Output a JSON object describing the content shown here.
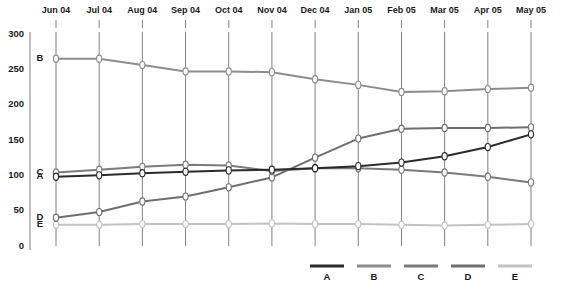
{
  "chart_data": {
    "type": "line",
    "title": "",
    "xlabel": "",
    "ylabel": "",
    "categories": [
      "Jun 04",
      "Jul 04",
      "Aug 04",
      "Sep 04",
      "Oct 04",
      "Nov 04",
      "Dec 04",
      "Jan 05",
      "Feb 05",
      "Mar 05",
      "Apr 05",
      "May 05"
    ],
    "ylim": [
      0,
      300
    ],
    "yticks": [
      0,
      50,
      100,
      150,
      200,
      250,
      300
    ],
    "grid": "vertical",
    "legend_position": "bottom-right",
    "series": [
      {
        "name": "A",
        "color": "#2b2b2b",
        "values": [
          98,
          100,
          103,
          105,
          107,
          108,
          110,
          113,
          118,
          127,
          140,
          158
        ]
      },
      {
        "name": "B",
        "color": "#8c8c8c",
        "values": [
          265,
          265,
          256,
          247,
          247,
          246,
          236,
          228,
          218,
          219,
          222,
          224
        ]
      },
      {
        "name": "C",
        "color": "#7a7a7a",
        "values": [
          104,
          108,
          112,
          115,
          114,
          106,
          110,
          110,
          108,
          104,
          98,
          90
        ]
      },
      {
        "name": "D",
        "color": "#6e6e6e",
        "values": [
          40,
          48,
          63,
          70,
          83,
          97,
          125,
          152,
          166,
          167,
          167,
          168
        ]
      },
      {
        "name": "E",
        "color": "#c2c2c2",
        "values": [
          30,
          30,
          31,
          31,
          31,
          32,
          31,
          31,
          30,
          29,
          30,
          31
        ]
      }
    ]
  },
  "series_tags": [
    {
      "label": "B",
      "series": "B"
    },
    {
      "label": "C",
      "series": "C"
    },
    {
      "label": "A",
      "series": "A"
    },
    {
      "label": "D",
      "series": "D"
    },
    {
      "label": "E",
      "series": "E"
    }
  ],
  "legend": {
    "entries": [
      {
        "label": "A",
        "color": "#2b2b2b"
      },
      {
        "label": "B",
        "color": "#8c8c8c"
      },
      {
        "label": "C",
        "color": "#7a7a7a"
      },
      {
        "label": "D",
        "color": "#6e6e6e"
      },
      {
        "label": "E",
        "color": "#c2c2c2"
      }
    ]
  }
}
